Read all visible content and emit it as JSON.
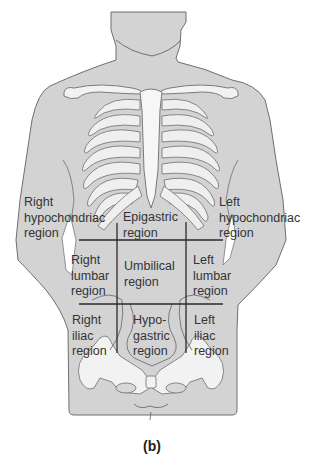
{
  "figure": {
    "caption": "(b)",
    "colors": {
      "body_fill": "#d3d3d3",
      "body_outline": "#6f6f6f",
      "bone_fill": "#f4f4f4",
      "bone_outline": "#7a7a7a",
      "grid_line": "#2a2a2a",
      "text": "#333333"
    }
  },
  "regions": [
    {
      "id": "right-hypochondriac",
      "label": "Right\nhypochondriac\nregion"
    },
    {
      "id": "epigastric",
      "label": "Epigastric\nregion"
    },
    {
      "id": "left-hypochondriac",
      "label": "Left\nhypochondriac\nregion"
    },
    {
      "id": "right-lumbar",
      "label": "Right\nlumbar\nregion"
    },
    {
      "id": "umbilical",
      "label": "Umbilical\nregion"
    },
    {
      "id": "left-lumbar",
      "label": "Left\nlumbar\nregion"
    },
    {
      "id": "right-iliac",
      "label": "Right\niliac\nregion"
    },
    {
      "id": "hypogastric",
      "label": "Hypo-\ngastric\nregion"
    },
    {
      "id": "left-iliac",
      "label": "Left\niliac\nregion"
    }
  ]
}
